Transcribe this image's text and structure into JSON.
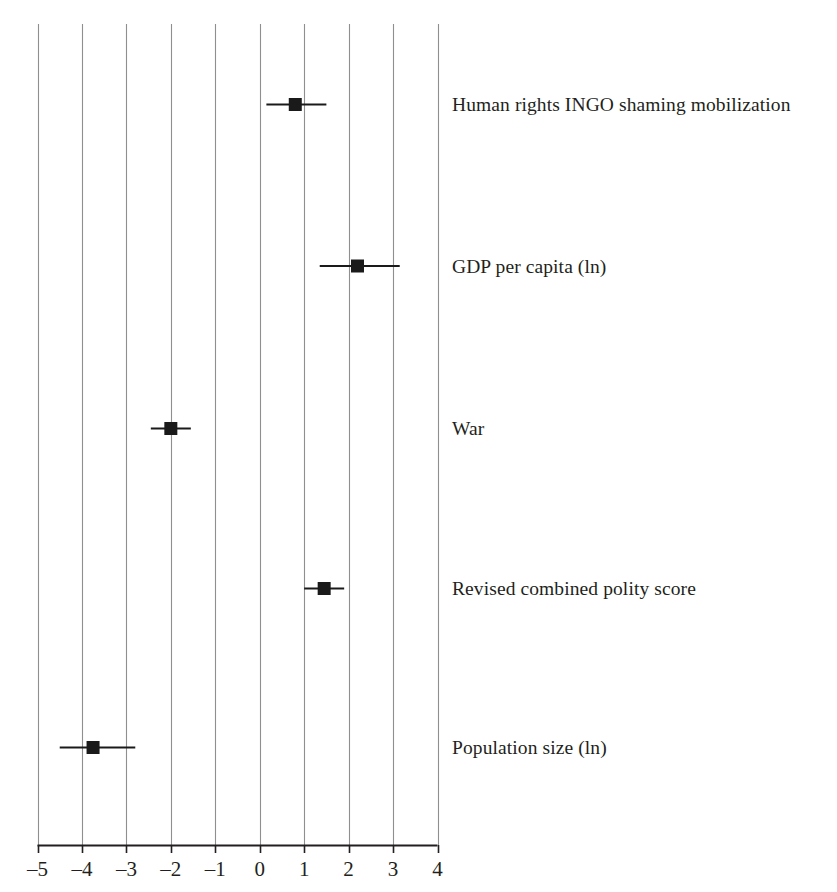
{
  "figure": {
    "background_color": "#ffffff",
    "ink_color": "#231f20",
    "gridline_color": "#8f8f8f",
    "marker_color": "#1a1a1a"
  },
  "axis": {
    "tick_labels": [
      "–5",
      "–4",
      "–3",
      "–2",
      "–1",
      "0",
      "1",
      "2",
      "3",
      "4"
    ],
    "tick_values": [
      -5,
      -4,
      -3,
      -2,
      -1,
      0,
      1,
      2,
      3,
      4
    ]
  },
  "chart_data": {
    "type": "scatter",
    "title": "",
    "subtitle": "",
    "xlabel": "",
    "ylabel": "",
    "xlim": [
      -5,
      4
    ],
    "xticks": [
      -5,
      -4,
      -3,
      -2,
      -1,
      0,
      1,
      2,
      3,
      4
    ],
    "xticklabels": [
      "–5",
      "–4",
      "–3",
      "–2",
      "–1",
      "0",
      "1",
      "2",
      "3",
      "4"
    ],
    "grid": "vertical gridlines at every x tick",
    "legend": "none",
    "orientation": "horizontal",
    "marker": "filled square with horizontal error bars (confidence intervals)",
    "categories": [
      "Human rights INGO shaming mobilization",
      "GDP per capita (ln)",
      "War",
      "Revised combined polity score",
      "Population size (ln)"
    ],
    "values": [
      0.8,
      2.2,
      -2.0,
      1.45,
      -3.75
    ],
    "ci_low": [
      0.15,
      1.35,
      -2.45,
      1.0,
      -4.5
    ],
    "ci_high": [
      1.5,
      3.15,
      -1.55,
      1.9,
      -2.8
    ],
    "points": [
      {
        "label": "Human rights INGO shaming mobilization",
        "estimate": 0.8,
        "ci_low": 0.15,
        "ci_high": 1.5
      },
      {
        "label": "GDP per capita (ln)",
        "estimate": 2.2,
        "ci_low": 1.35,
        "ci_high": 3.15
      },
      {
        "label": "War",
        "estimate": -2.0,
        "ci_low": -2.45,
        "ci_high": -1.55
      },
      {
        "label": "Revised combined polity score",
        "estimate": 1.45,
        "ci_low": 1.0,
        "ci_high": 1.9
      },
      {
        "label": "Population size (ln)",
        "estimate": -3.75,
        "ci_low": -4.5,
        "ci_high": -2.8
      }
    ]
  }
}
